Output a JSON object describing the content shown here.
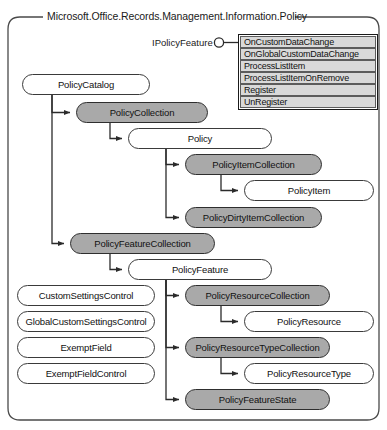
{
  "namespace": {
    "title": "Microsoft.Office.Records.Management.Information.Policy"
  },
  "interface": {
    "name": "IPolicyFeature",
    "icon": "lollipop-interface-icon",
    "methods": [
      "OnCustomDataChange",
      "OnGlobalCustomDataChange",
      "ProcessListItem",
      "ProcessListItemOnRemove",
      "Register",
      "UnRegister"
    ]
  },
  "colors": {
    "shaded_fill": "#a9a9a9",
    "plain_fill": "#ffffff",
    "stroke": "#3a3a3a",
    "method_row_fill": "#d9d9d9"
  },
  "nodes": [
    {
      "id": "policy-catalog",
      "label": "PolicyCatalog",
      "shaded": false,
      "x": 22,
      "y": 74,
      "w": 128
    },
    {
      "id": "policy-collection",
      "label": "PolicyCollection",
      "shaded": true,
      "x": 76,
      "y": 102,
      "w": 132
    },
    {
      "id": "policy",
      "label": "Policy",
      "shaded": false,
      "x": 128,
      "y": 128,
      "w": 144
    },
    {
      "id": "policy-item-collection",
      "label": "PolicyItemCollection",
      "shaded": true,
      "x": 185,
      "y": 154,
      "w": 137
    },
    {
      "id": "policy-item",
      "label": "PolicyItem",
      "shaded": false,
      "x": 244,
      "y": 180,
      "w": 130
    },
    {
      "id": "policy-dirty-item-collection",
      "label": "PolicyDirtyItemCollection",
      "shaded": true,
      "x": 185,
      "y": 207,
      "w": 137
    },
    {
      "id": "policy-feature-collection",
      "label": "PolicyFeatureCollection",
      "shaded": true,
      "x": 70,
      "y": 233,
      "w": 145
    },
    {
      "id": "policy-feature",
      "label": "PolicyFeature",
      "shaded": false,
      "x": 128,
      "y": 259,
      "w": 144
    },
    {
      "id": "policy-resource-collection",
      "label": "PolicyResourceCollection",
      "shaded": true,
      "x": 185,
      "y": 285,
      "w": 145
    },
    {
      "id": "policy-resource",
      "label": "PolicyResource",
      "shaded": false,
      "x": 244,
      "y": 311,
      "w": 130
    },
    {
      "id": "policy-resource-type-collection",
      "label": "PolicyResourceTypeCollection",
      "shaded": true,
      "x": 185,
      "y": 337,
      "w": 145
    },
    {
      "id": "policy-resource-type",
      "label": "PolicyResourceType",
      "shaded": false,
      "x": 244,
      "y": 363,
      "w": 130
    },
    {
      "id": "policy-feature-state",
      "label": "PolicyFeatureState",
      "shaded": true,
      "x": 185,
      "y": 389,
      "w": 145
    },
    {
      "id": "custom-settings-control",
      "label": "CustomSettingsControl",
      "shaded": false,
      "x": 17,
      "y": 285,
      "w": 138
    },
    {
      "id": "global-custom-settings-control",
      "label": "GlobalCustomSettingsControl",
      "shaded": false,
      "x": 17,
      "y": 311,
      "w": 138
    },
    {
      "id": "exempt-field",
      "label": "ExemptField",
      "shaded": false,
      "x": 17,
      "y": 337,
      "w": 138
    },
    {
      "id": "exempt-field-control",
      "label": "ExemptFieldControl",
      "shaded": false,
      "x": 17,
      "y": 363,
      "w": 138
    }
  ]
}
